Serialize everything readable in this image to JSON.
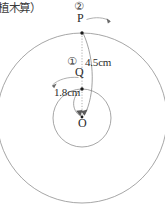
{
  "figure": {
    "caption": "植木算）",
    "labels": {
      "outer_marker": "②",
      "point_p": "P",
      "inner_marker": "①",
      "point_q": "Q",
      "center_point": "O",
      "outer_radius": "4.5cm",
      "inner_radius": "1.8cm"
    },
    "geometry": {
      "center_x": 82,
      "center_y": 118,
      "outer_radius_px": 85,
      "inner_radius_px": 29,
      "point_p_x": 82,
      "point_p_y": 33,
      "point_q_x": 82,
      "point_q_y": 89
    },
    "colors": {
      "stroke": "#8a8a8a",
      "text": "#2b2b2b",
      "dot": "#1a1a1a",
      "background": "#ffffff"
    }
  }
}
